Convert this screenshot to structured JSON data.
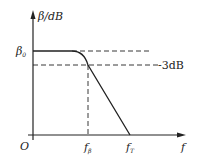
{
  "diagram": {
    "type": "bode-magnitude-plot",
    "y_axis": {
      "symbol": "β",
      "unit": "/dB"
    },
    "x_axis": {
      "symbol": "f"
    },
    "origin": "O",
    "levels": {
      "beta0": {
        "symbol": "β",
        "subscript": "0"
      },
      "minus3db": "-3dB"
    },
    "frequencies": {
      "f_beta": {
        "symbol": "f",
        "subscript": "β"
      },
      "f_T": {
        "symbol": "f",
        "subscript": "T"
      }
    },
    "colors": {
      "line": "#222222",
      "background": "#ffffff"
    }
  }
}
